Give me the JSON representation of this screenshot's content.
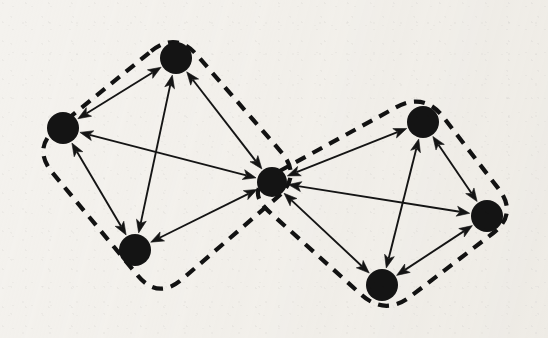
{
  "figure": {
    "type": "node-link-diagram",
    "width": 548,
    "height": 338,
    "background_color": "#f4f2ee",
    "ink_color": "#121212"
  },
  "style": {
    "node_fill": "#141414",
    "node_radius": 16,
    "hub_radius": 15,
    "edge_color": "#141414",
    "edge_width": 1.9,
    "hull_color": "#121212",
    "hull_width": 4.2,
    "hull_dash": "11 8",
    "arrowhead_length": 13,
    "arrowhead_half_width": 5
  },
  "graph_data": {
    "directed": true,
    "all_edges_bidirectional": true,
    "node_count": 7,
    "edge_count": 12,
    "cluster_count": 2,
    "nodes": [
      {
        "id": "n1",
        "label": "",
        "x": 63,
        "y": 128,
        "r": 16,
        "cluster": "left",
        "role": "member"
      },
      {
        "id": "n2",
        "label": "",
        "x": 176,
        "y": 58,
        "r": 16,
        "cluster": "left",
        "role": "member"
      },
      {
        "id": "n3",
        "label": "",
        "x": 135,
        "y": 250,
        "r": 16,
        "cluster": "left",
        "role": "member"
      },
      {
        "id": "n4",
        "label": "",
        "x": 272,
        "y": 182,
        "r": 15,
        "cluster": "both",
        "role": "hub"
      },
      {
        "id": "n5",
        "label": "",
        "x": 423,
        "y": 122,
        "r": 16,
        "cluster": "right",
        "role": "member"
      },
      {
        "id": "n6",
        "label": "",
        "x": 487,
        "y": 216,
        "r": 16,
        "cluster": "right",
        "role": "member"
      },
      {
        "id": "n7",
        "label": "",
        "x": 382,
        "y": 285,
        "r": 16,
        "cluster": "right",
        "role": "member"
      }
    ],
    "edges": [
      {
        "id": "e1",
        "source": "n1",
        "target": "n2",
        "bidirectional": true,
        "cluster": "left"
      },
      {
        "id": "e2",
        "source": "n1",
        "target": "n3",
        "bidirectional": true,
        "cluster": "left"
      },
      {
        "id": "e3",
        "source": "n1",
        "target": "n4",
        "bidirectional": true,
        "cluster": "left"
      },
      {
        "id": "e4",
        "source": "n2",
        "target": "n3",
        "bidirectional": true,
        "cluster": "left"
      },
      {
        "id": "e5",
        "source": "n2",
        "target": "n4",
        "bidirectional": true,
        "cluster": "left"
      },
      {
        "id": "e6",
        "source": "n3",
        "target": "n4",
        "bidirectional": true,
        "cluster": "left"
      },
      {
        "id": "e7",
        "source": "n4",
        "target": "n5",
        "bidirectional": true,
        "cluster": "right"
      },
      {
        "id": "e8",
        "source": "n4",
        "target": "n6",
        "bidirectional": true,
        "cluster": "right"
      },
      {
        "id": "e9",
        "source": "n4",
        "target": "n7",
        "bidirectional": true,
        "cluster": "right"
      },
      {
        "id": "e10",
        "source": "n5",
        "target": "n6",
        "bidirectional": true,
        "cluster": "right"
      },
      {
        "id": "e11",
        "source": "n5",
        "target": "n7",
        "bidirectional": true,
        "cluster": "right"
      },
      {
        "id": "e12",
        "source": "n6",
        "target": "n7",
        "bidirectional": true,
        "cluster": "right"
      }
    ],
    "clusters": [
      {
        "id": "left",
        "label": "",
        "members": [
          "n1",
          "n2",
          "n3",
          "n4"
        ],
        "boundary_style": "dashed",
        "shape": "rounded-quadrilateral",
        "hull_points": [
          [
            176,
            31
          ],
          [
            302,
            176
          ],
          [
            158,
            300
          ],
          [
            32,
            148
          ]
        ],
        "corner_radius": 32
      },
      {
        "id": "right",
        "label": "",
        "members": [
          "n4",
          "n5",
          "n6",
          "n7"
        ],
        "boundary_style": "dashed",
        "shape": "rounded-quadrilateral",
        "hull_points": [
          [
            424,
            92
          ],
          [
            518,
            214
          ],
          [
            385,
            316
          ],
          [
            245,
            190
          ]
        ],
        "corner_radius": 32
      }
    ]
  }
}
